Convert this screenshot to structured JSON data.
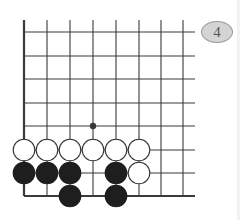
{
  "diagram": {
    "type": "go-board-fragment",
    "problem_number": "4",
    "colors": {
      "line": "#3a3a3a",
      "black_stone": "#1e1e1e",
      "white_stone": "#ffffff",
      "badge_fill": "#d4d4d4"
    },
    "grid": {
      "columns_x": [
        24,
        47,
        70,
        93,
        116,
        139,
        161,
        183
      ],
      "rows_y": [
        32,
        56,
        79,
        103,
        126,
        150,
        173,
        196
      ],
      "open_right_to": 195,
      "open_top_from": 20,
      "edges": [
        "left",
        "bottom"
      ]
    },
    "star_points": [
      {
        "col": 3,
        "row": 4
      }
    ],
    "stones": [
      {
        "color": "white",
        "col": 0,
        "row": 5
      },
      {
        "color": "white",
        "col": 1,
        "row": 5
      },
      {
        "color": "white",
        "col": 2,
        "row": 5
      },
      {
        "color": "white",
        "col": 3,
        "row": 5
      },
      {
        "color": "white",
        "col": 4,
        "row": 5
      },
      {
        "color": "white",
        "col": 5,
        "row": 5
      },
      {
        "color": "black",
        "col": 0,
        "row": 6
      },
      {
        "color": "black",
        "col": 1,
        "row": 6
      },
      {
        "color": "black",
        "col": 2,
        "row": 6
      },
      {
        "color": "black",
        "col": 4,
        "row": 6
      },
      {
        "color": "white",
        "col": 5,
        "row": 6
      },
      {
        "color": "black",
        "col": 2,
        "row": 7
      },
      {
        "color": "black",
        "col": 4,
        "row": 7
      }
    ]
  }
}
